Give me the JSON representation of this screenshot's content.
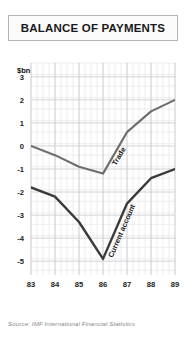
{
  "title": "BALANCE OF PAYMENTS",
  "source": {
    "prefix": "Source:",
    "organisation": "IMF",
    "publication": "International Financial Statistics",
    "full": "Source: IMF International Financial Statistics"
  },
  "colors": {
    "trade_line": "#6e6e6e",
    "current_account_line": "#3a3a3a",
    "grid_minor": "#e2e2e6",
    "grid_major": "#c9c9cf",
    "axis_text": "#222222",
    "title_text": "#1a1a1a",
    "source_text": "#8a8a8a",
    "panel_bg": "#ffffff",
    "title_border": "#b4b4b4"
  },
  "chart_data": {
    "type": "line",
    "title": "BALANCE OF PAYMENTS",
    "xlabel": "",
    "ylabel": "$bn",
    "unit_label": "$bn",
    "x": [
      "83",
      "84",
      "85",
      "86",
      "87",
      "88",
      "89"
    ],
    "categories": [
      "83",
      "84",
      "85",
      "86",
      "87",
      "88",
      "89"
    ],
    "xtick_labels": [
      "83",
      "84",
      "85",
      "86",
      "87",
      "88",
      "89"
    ],
    "ytick_labels": [
      "3",
      "2",
      "1",
      "0",
      "-1",
      "-2",
      "-3",
      "-4",
      "-5"
    ],
    "ytick_values": [
      3,
      2,
      1,
      0,
      -1,
      -2,
      -3,
      -4,
      -5
    ],
    "ylim": [
      -5.6,
      3.6
    ],
    "xlim": [
      "83",
      "89"
    ],
    "grid": true,
    "legend_position": "inline-on-curve",
    "series": [
      {
        "name": "Trade",
        "label": "Trade",
        "color": "#6e6e6e",
        "values": [
          0.0,
          -0.4,
          -0.9,
          -1.2,
          0.6,
          1.5,
          2.0
        ]
      },
      {
        "name": "Current account",
        "label": "Current account",
        "color": "#3a3a3a",
        "values": [
          -1.8,
          -2.2,
          -3.3,
          -4.9,
          -2.5,
          -1.4,
          -1.0
        ]
      }
    ],
    "annotations": [
      {
        "text": "Trade",
        "series": "Trade"
      },
      {
        "text": "Current account",
        "series": "Current account"
      }
    ]
  }
}
